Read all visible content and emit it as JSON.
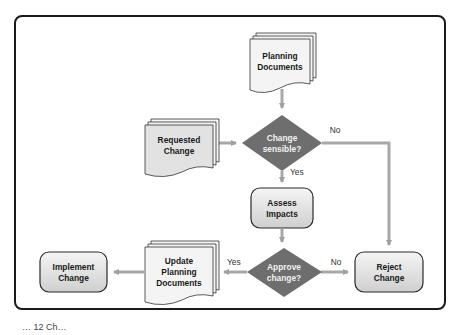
{
  "diagram": {
    "type": "flowchart",
    "nodes": {
      "planning_documents": {
        "label_line1": "Planning",
        "label_line2": "Documents",
        "shape": "multi-document"
      },
      "requested_change": {
        "label_line1": "Requested",
        "label_line2": "Change",
        "shape": "multi-document"
      },
      "change_sensible": {
        "label_line1": "Change",
        "label_line2": "sensible?",
        "shape": "decision"
      },
      "assess_impacts": {
        "label_line1": "Assess",
        "label_line2": "Impacts",
        "shape": "process"
      },
      "approve_change": {
        "label_line1": "Approve",
        "label_line2": "change?",
        "shape": "decision"
      },
      "reject_change": {
        "label_line1": "Reject",
        "label_line2": "Change",
        "shape": "process"
      },
      "update_planning_documents": {
        "label_line1": "Update",
        "label_line2": "Planning",
        "label_line3": "Documents",
        "shape": "multi-document"
      },
      "implement_change": {
        "label_line1": "Implement",
        "label_line2": "Change",
        "shape": "process"
      }
    },
    "edges": {
      "sensible_no": "No",
      "sensible_yes": "Yes",
      "approve_yes": "Yes",
      "approve_no": "No"
    },
    "colors": {
      "frame": "#1a1a1a",
      "arrow": "#a8a8a8",
      "decision_fill": "#6e6e6e",
      "box_fill": "#e6e6e6",
      "box_stroke": "#2a2a2a",
      "document_fill": "#f4f4f4"
    }
  },
  "caption": {
    "text": "… 12 Ch…"
  }
}
